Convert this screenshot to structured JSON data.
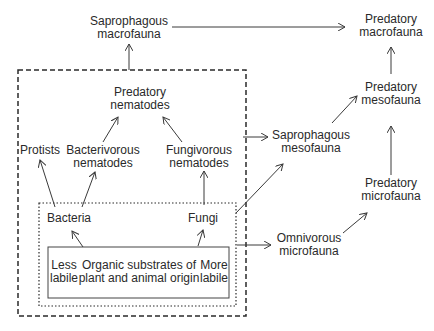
{
  "diagram": {
    "type": "soil food web",
    "nodes": {
      "saprophagous_macrofauna": {
        "line1": "Saprophagous",
        "line2": "macrofauna"
      },
      "predatory_macrofauna": {
        "line1": "Predatory",
        "line2": "macrofauna"
      },
      "predatory_mesofauna": {
        "line1": "Predatory",
        "line2": "mesofauna"
      },
      "predatory_microfauna": {
        "line1": "Predatory",
        "line2": "microfauna"
      },
      "saprophagous_mesofauna": {
        "line1": "Saprophagous",
        "line2": "mesofauna"
      },
      "omnivorous_microfauna": {
        "line1": "Omnivorous",
        "line2": "microfauna"
      },
      "predatory_nematodes": {
        "line1": "Predatory",
        "line2": "nematodes"
      },
      "protists": {
        "line1": "Protists"
      },
      "bacterivorous_nematodes": {
        "line1": "Bacterivorous",
        "line2": "nematodes"
      },
      "fungivorous_nematodes": {
        "line1": "Fungivorous",
        "line2": "nematodes"
      },
      "bacteria": {
        "line1": "Bacteria"
      },
      "fungi": {
        "line1": "Fungi"
      },
      "less_labile": {
        "line1": "Less",
        "line2": "labile"
      },
      "organic_substrates": {
        "line1": "Organic substrates of",
        "line2": "plant and animal origin"
      },
      "more_labile": {
        "line1": "More",
        "line2": "labile"
      }
    },
    "edges": [
      {
        "from": "Organic substrates",
        "to": "Bacteria"
      },
      {
        "from": "Organic substrates",
        "to": "Fungi"
      },
      {
        "from": "Bacteria",
        "to": "Protists"
      },
      {
        "from": "Bacteria",
        "to": "Bacterivorous nematodes"
      },
      {
        "from": "Fungi",
        "to": "Fungivorous nematodes"
      },
      {
        "from": "Bacterivorous nematodes",
        "to": "Predatory nematodes"
      },
      {
        "from": "Fungivorous nematodes",
        "to": "Predatory nematodes"
      },
      {
        "from": "Dashed box (soil micro-community)",
        "to": "Saprophagous macrofauna"
      },
      {
        "from": "Dashed box (soil micro-community)",
        "to": "Saprophagous mesofauna"
      },
      {
        "from": "Dotted box (microorganisms + substrates)",
        "to": "Saprophagous mesofauna"
      },
      {
        "from": "Solid box (substrates)",
        "to": "Omnivorous microfauna"
      },
      {
        "from": "Saprophagous macrofauna",
        "to": "Predatory macrofauna"
      },
      {
        "from": "Saprophagous mesofauna",
        "to": "Predatory mesofauna"
      },
      {
        "from": "Omnivorous microfauna",
        "to": "Predatory microfauna"
      },
      {
        "from": "Predatory microfauna",
        "to": "Predatory mesofauna"
      },
      {
        "from": "Predatory mesofauna",
        "to": "Predatory macrofauna"
      }
    ],
    "colors": {
      "line": "#3a3a3a",
      "text": "#2a2a2a",
      "background": "#ffffff"
    }
  }
}
